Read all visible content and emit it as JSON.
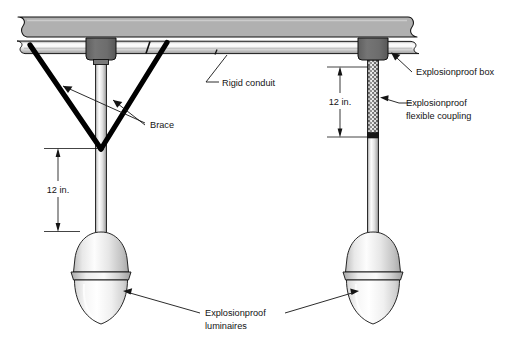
{
  "figure": {
    "labels": {
      "rigid_conduit": "Rigid conduit",
      "brace": "Brace",
      "explosionproof_box": "Explosionproof box",
      "explosionproof_coupling_line1": "Explosionproof",
      "explosionproof_coupling_line2": "flexible coupling",
      "luminaires_line1": "Explosionproof",
      "luminaires_line2": "luminaires"
    },
    "dimensions": {
      "left_drop": "12 in.",
      "right_drop": "12 in."
    },
    "colors": {
      "slab_fill": "#b0b0b0",
      "slab_stroke": "#111111",
      "box_fill": "#6e6e6e",
      "pipe_light": "#f2f2f2",
      "pipe_mid": "#cccccc",
      "pipe_dark": "#8a8a8a",
      "brace_stroke": "#000000",
      "globe_light": "#fbfbfb",
      "globe_shade": "#c9c9c9",
      "text": "#141414",
      "background": "#ffffff"
    }
  }
}
